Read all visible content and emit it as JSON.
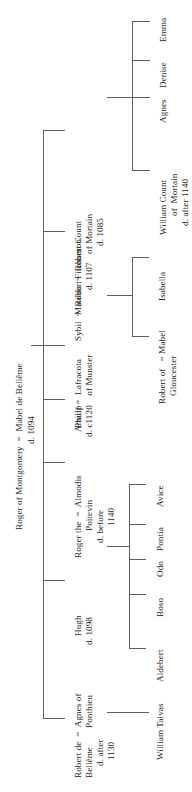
{
  "chart_type": "genealogical-family-tree",
  "orientation": "rotated-90-ccw",
  "title": "Roger of Montgomery  =  Mabel de Bellême",
  "title_death": "d. 1094",
  "generations": {
    "g1": {
      "name": "Roger of Montgomery  =  Mabel de Bellême",
      "death": "d. 1094"
    },
    "g2": [
      {
        "key": "robert-de-belleme",
        "line1": "Robert de  =  Agnes of",
        "line2": "Bellême        Ponthieu",
        "line3": "d. after",
        "line4": "1130",
        "children": [
          "William Talvas"
        ]
      },
      {
        "key": "hugh",
        "line1": "Hugh",
        "line2": "d. 1098",
        "children": []
      },
      {
        "key": "roger-the-poitevin",
        "line1": "Roger the  =  Almodis",
        "line2": "Poitevin",
        "line3": "d. before",
        "line4": "1140",
        "children": [
          "Aldebert",
          "Boso",
          "Odo",
          "Pontia",
          "Avice"
        ]
      },
      {
        "key": "philip",
        "line1": "Philip",
        "children": []
      },
      {
        "key": "arnulf",
        "line1": "Arnulf =  Lafracota",
        "line2": "d. c1120    of Munster",
        "children": []
      },
      {
        "key": "sybil",
        "line1": "Sybil  =  Robert Fitzhamon",
        "line2": "d. 1107",
        "children": [
          "Robert of  = Mabel",
          "Gloucester",
          "Isabella"
        ]
      },
      {
        "key": "matilda",
        "line1": "Matilda  =  Robert Count",
        "line2": "of Mortain",
        "line3": "d. 1085",
        "children": [
          "William Count",
          "of Mortain",
          "d. after 1140",
          "Agnes",
          "Denise",
          "Emma"
        ]
      }
    ],
    "g3": {
      "william_talvas": "William Talvas",
      "poitevin_children": [
        "Aldebert",
        "Boso",
        "Odo",
        "Pontia",
        "Avice"
      ],
      "gloucester_line1": "Robert of   = Mabel",
      "gloucester_line2": "Gloucester",
      "isabella": "Isabella",
      "mortain_line1": "William Count",
      "mortain_line2": "of  Mortain",
      "mortain_line3": "d. after 1140",
      "agnes": "Agnes",
      "denise": "Denise",
      "emma": "Emma"
    }
  },
  "colors": {
    "line": "#5f5f5f",
    "text": "#1d1d1d",
    "background": "#ffffff"
  }
}
